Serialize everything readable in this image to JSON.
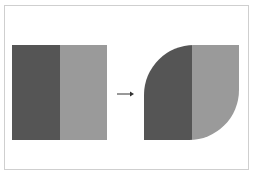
{
  "diagram": {
    "colors": {
      "dark": "#555555",
      "light": "#9a9a9a",
      "frame": "#cfcfcf",
      "arrow": "#333333"
    },
    "before": {
      "label": ""
    },
    "after": {
      "label": ""
    },
    "arrow": {
      "direction": "right"
    }
  }
}
